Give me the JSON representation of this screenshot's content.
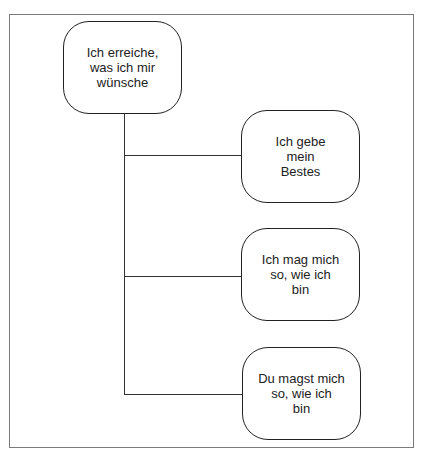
{
  "diagram": {
    "root": {
      "label_lines": [
        "Ich erreiche,",
        "was ich mir",
        "wünsche"
      ]
    },
    "children": [
      {
        "label_lines": [
          "Ich gebe",
          "mein",
          "Bestes"
        ]
      },
      {
        "label_lines": [
          "Ich mag mich",
          "so, wie ich",
          "bin"
        ]
      },
      {
        "label_lines": [
          "Du magst mich",
          "so, wie ich",
          "bin"
        ]
      }
    ]
  }
}
